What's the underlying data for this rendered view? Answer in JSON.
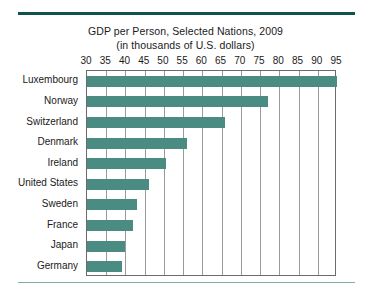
{
  "chart_data": {
    "type": "bar",
    "orientation": "horizontal",
    "title": "GDP per Person, Selected Nations, 2009",
    "subtitle": "(in thousands of U.S. dollars)",
    "xlabel": "",
    "ylabel": "",
    "xlim": [
      30,
      95
    ],
    "xticks": [
      30,
      35,
      40,
      45,
      50,
      55,
      60,
      65,
      70,
      75,
      80,
      85,
      90,
      95
    ],
    "grid": "vertical",
    "legend": "none",
    "bar_color": "#4a8c82",
    "categories": [
      "Luxembourg",
      "Norway",
      "Switzerland",
      "Denmark",
      "Ireland",
      "United States",
      "Sweden",
      "France",
      "Japan",
      "Germany"
    ],
    "values": [
      95,
      77,
      66,
      56,
      50.5,
      46,
      43,
      42,
      40,
      39
    ],
    "units": "thousands of U.S. dollars"
  },
  "colors": {
    "bar": "#4a8c82",
    "rule_top": "#10534a",
    "rule_bottom": "#7fada6",
    "frame": "#6b6b6b",
    "gridline": "#9a9a9a",
    "background": "#ffffff",
    "text": "#1a1a1a"
  }
}
